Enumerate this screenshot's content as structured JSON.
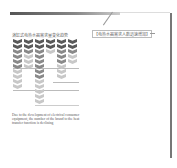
{
  "page": {
    "figure_title": "浴缸式电热水器需求量变化趋势",
    "callout_label": "【电热水器需求人数迅速增加】",
    "caption": "Due to the development of electrical consumer equipment, the number of the brand to the heat transfer function is declining"
  },
  "chart_data": {
    "type": "bar",
    "title": "浴缸式电热水器需求量变化趋势",
    "categories": [
      "1",
      "2",
      "3",
      "4",
      "5",
      "6"
    ],
    "values": [
      10,
      6,
      13,
      3,
      8,
      5
    ],
    "shape": "stacked chevron glyphs (pictogram)",
    "xlabel": "",
    "ylabel": "",
    "colors": {
      "dark": "#5a5a5a",
      "mid": "#8a8a8a",
      "light": "#c8c8c8"
    },
    "reference_lines_y": [
      68,
      82,
      90,
      105
    ]
  }
}
